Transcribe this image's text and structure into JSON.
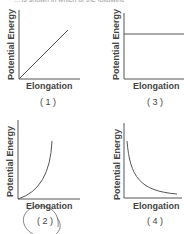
{
  "header": {
    "cut_text": "... is shown in which of the following graphs?"
  },
  "options": [
    {
      "id": "1",
      "label": "( 1 )",
      "shape": "linear-increasing",
      "ylabel": "Potential Energy",
      "xlabel": "Elongation"
    },
    {
      "id": "3",
      "label": "( 3 )",
      "shape": "constant",
      "ylabel": "Potential Energy",
      "xlabel": "Elongation"
    },
    {
      "id": "2",
      "label": "( 2 )",
      "shape": "parabolic-increasing",
      "ylabel": "Potential Energy",
      "xlabel": "Elongation",
      "circled": true
    },
    {
      "id": "4",
      "label": "( 4 )",
      "shape": "decreasing-hyperbolic",
      "ylabel": "Potential Energy",
      "xlabel": "Elongation"
    }
  ],
  "colors": {
    "axis": "#555555",
    "curve": "#555555",
    "circle_mark": "#666666"
  }
}
